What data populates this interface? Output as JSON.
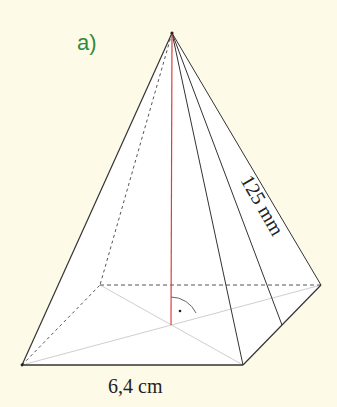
{
  "figure": {
    "part_label": "a)",
    "base_edge_label": "6,4 cm",
    "slant_edge_label": "125 mm",
    "colors": {
      "background": "#fdfbe8",
      "label_green": "#2e8b3e",
      "height_line": "#d9403a",
      "edge": "#333333",
      "hidden_edge": "#555555",
      "diagonal": "#cccccc",
      "face_fill": "#ffffff"
    },
    "points": {
      "apex": [
        172,
        33
      ],
      "front_left": [
        22,
        365
      ],
      "front_right": [
        243,
        365
      ],
      "back_right": [
        321,
        285
      ],
      "back_left": [
        100,
        285
      ],
      "base_center": [
        171,
        325
      ]
    },
    "right_angle_marker": true
  }
}
